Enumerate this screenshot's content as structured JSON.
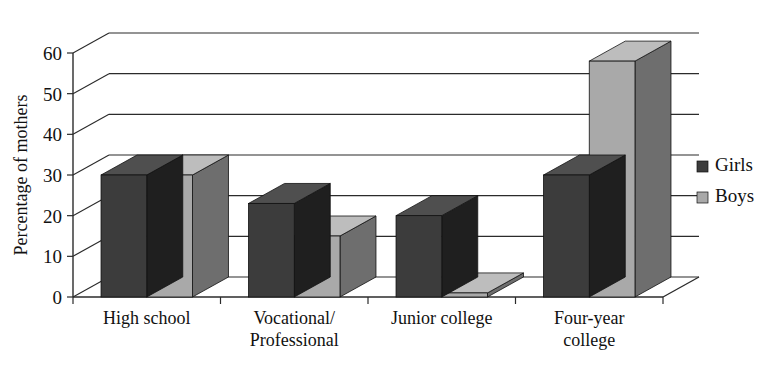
{
  "chart_data": {
    "type": "bar",
    "title": "",
    "subtitle": "",
    "xlabel": "",
    "ylabel": "Percentage of mothers",
    "ylim": [
      0,
      60
    ],
    "yticks": [
      0,
      10,
      20,
      30,
      40,
      50,
      60
    ],
    "ytick_labels": [
      "0",
      "10",
      "20",
      "30",
      "40",
      "50",
      "60"
    ],
    "grid": true,
    "style": "3d-column",
    "legend_position": "right",
    "categories": [
      "High school",
      "Vocational/\nProfessional",
      "Junior college",
      "Four-year\ncollege"
    ],
    "category_lines": [
      [
        "High school"
      ],
      [
        "Vocational/",
        "Professional"
      ],
      [
        "Junior college"
      ],
      [
        "Four-year",
        "college"
      ]
    ],
    "series": [
      {
        "name": "Girls",
        "color": "#3c3c3c",
        "values": [
          30,
          23,
          20,
          30
        ]
      },
      {
        "name": "Boys",
        "color": "#a9a9a9",
        "values": [
          30,
          15,
          1,
          58
        ]
      }
    ]
  },
  "legend": {
    "items": [
      {
        "label": "Girls",
        "color": "#3c3c3c"
      },
      {
        "label": "Boys",
        "color": "#a9a9a9"
      }
    ]
  },
  "colors": {
    "girls": "#3c3c3c",
    "girls_side": "#1f1f1f",
    "girls_top": "#4f4f4f",
    "boys": "#a9a9a9",
    "boys_side": "#6e6e6e",
    "boys_top": "#bdbdbd",
    "axis": "#2b2b2b",
    "background": "#ffffff"
  }
}
